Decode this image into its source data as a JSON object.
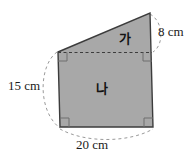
{
  "figure": {
    "shape_fill_color": "#a8a8a8",
    "shape_stroke_color": "#3c3c3c",
    "guide_color": "#9a9a9a",
    "background_color": "#ffffff",
    "text_color": "#1a1a1a",
    "regions": [
      {
        "id": "ga",
        "label": "가",
        "kind": "triangle"
      },
      {
        "id": "na",
        "label": "나",
        "kind": "rectangle"
      }
    ],
    "dimensions": [
      {
        "id": "right-side",
        "label": "8 cm",
        "value": 8,
        "unit": "cm",
        "position": "right"
      },
      {
        "id": "left-side",
        "label": "15 cm",
        "value": 15,
        "unit": "cm",
        "position": "left"
      },
      {
        "id": "bottom-side",
        "label": "20 cm",
        "value": 20,
        "unit": "cm",
        "position": "bottom"
      }
    ],
    "right_angle_markers": 4,
    "divider": "dashed horizontal line between triangle and rectangle"
  }
}
